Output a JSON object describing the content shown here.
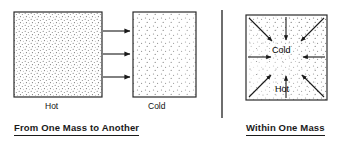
{
  "figure": {
    "background_color": "#ffffff",
    "line_color": "#1a1a1a",
    "stipple_color": "#555555"
  },
  "panels": [
    {
      "id": "from-one-mass-to-another",
      "caption": "From One Mass to Another",
      "boxes": [
        {
          "id": "hot-body",
          "label": "Hot",
          "stipple": "dense-uniform"
        },
        {
          "id": "cold-body",
          "label": "Cold",
          "stipple": "dense-left-fading-right"
        }
      ],
      "arrows": [
        {
          "id": "transfer-arrow-1",
          "direction": "right"
        },
        {
          "id": "transfer-arrow-2",
          "direction": "right"
        },
        {
          "id": "transfer-arrow-3",
          "direction": "right"
        }
      ]
    },
    {
      "id": "within-one-mass",
      "caption": "Within One Mass",
      "boxes": [
        {
          "id": "single-body",
          "label": "",
          "stipple": "dense-edges-sparse-center"
        }
      ],
      "inner_labels": [
        {
          "id": "cold-region-label",
          "text": "Cold"
        },
        {
          "id": "hot-region-label",
          "text": "Hot"
        }
      ],
      "arrows": [
        {
          "id": "inward-arrow-top-left",
          "direction": "down-right"
        },
        {
          "id": "inward-arrow-top",
          "direction": "down"
        },
        {
          "id": "inward-arrow-top-right",
          "direction": "down-left"
        },
        {
          "id": "inward-arrow-left",
          "direction": "right"
        },
        {
          "id": "inward-arrow-right",
          "direction": "left"
        },
        {
          "id": "inward-arrow-bottom-left",
          "direction": "up-right"
        },
        {
          "id": "inward-arrow-bottom",
          "direction": "up"
        },
        {
          "id": "inward-arrow-bottom-right",
          "direction": "up-left"
        }
      ]
    }
  ],
  "divider": {
    "id": "panel-divider",
    "orientation": "vertical"
  }
}
